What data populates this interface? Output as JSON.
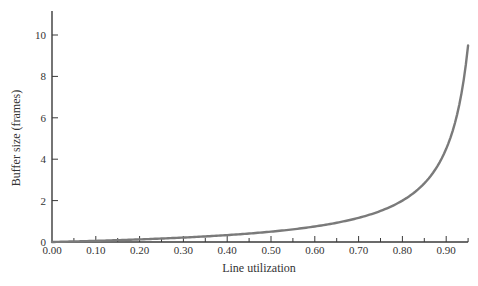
{
  "chart_data": {
    "type": "line",
    "title": "",
    "xlabel": "Line utilization",
    "ylabel": "Buffer size (frames)",
    "xlim": [
      0.0,
      0.95
    ],
    "ylim": [
      0,
      11
    ],
    "x_ticks": [
      "0.00",
      "0.10",
      "0.20",
      "0.30",
      "0.40",
      "0.50",
      "0.60",
      "0.70",
      "0.80",
      "0.90"
    ],
    "y_ticks": [
      "0",
      "2",
      "4",
      "6",
      "8",
      "10"
    ],
    "grid": false,
    "legend": null,
    "series": [
      {
        "name": "Buffer size",
        "color": "#7a7a7a",
        "x": [
          0.0,
          0.05,
          0.1,
          0.15,
          0.2,
          0.25,
          0.3,
          0.35,
          0.4,
          0.45,
          0.5,
          0.55,
          0.6,
          0.65,
          0.7,
          0.75,
          0.8,
          0.85,
          0.88,
          0.9,
          0.92,
          0.94,
          0.95
        ],
        "values": [
          0.0,
          0.03,
          0.06,
          0.09,
          0.13,
          0.17,
          0.21,
          0.27,
          0.33,
          0.41,
          0.5,
          0.61,
          0.75,
          0.93,
          1.17,
          1.5,
          2.0,
          2.83,
          3.67,
          4.5,
          5.75,
          7.83,
          9.5
        ]
      }
    ]
  },
  "axes": {
    "x_title": "Line utilization",
    "y_title": "Buffer size (frames)"
  }
}
